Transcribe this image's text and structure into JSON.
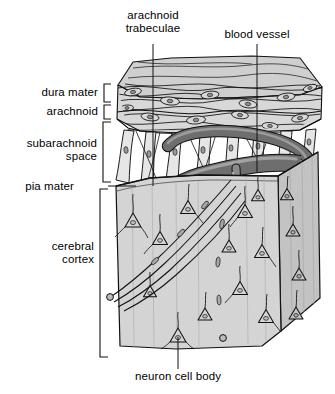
{
  "figure": {
    "type": "anatomical-illustration",
    "style": "grayscale line drawing"
  },
  "labels": {
    "arachnoid_trabeculae": "arachnoid\ntrabeculae",
    "blood_vessel": "blood vessel",
    "dura_mater": "dura mater",
    "arachnoid": "arachnoid",
    "subarachnoid_space": "subarachnoid\nspace",
    "pia_mater": "pia mater",
    "cerebral_cortex": "cerebral\ncortex",
    "neuron_cell_body": "neuron cell body"
  },
  "structures": [
    {
      "name": "dura mater",
      "kind": "membrane-layer",
      "label_side": "left",
      "bracket": true
    },
    {
      "name": "arachnoid",
      "kind": "membrane-layer",
      "label_side": "left",
      "bracket": true
    },
    {
      "name": "subarachnoid space",
      "kind": "space",
      "label_side": "left",
      "bracket": true
    },
    {
      "name": "pia mater",
      "kind": "membrane-layer",
      "label_side": "left",
      "bracket": false
    },
    {
      "name": "cerebral cortex",
      "kind": "tissue-block",
      "label_side": "left",
      "bracket": true
    },
    {
      "name": "arachnoid trabeculae",
      "kind": "strands",
      "label_side": "top",
      "bracket": false
    },
    {
      "name": "blood vessel",
      "kind": "vessel",
      "label_side": "top",
      "bracket": false
    },
    {
      "name": "neuron cell body",
      "kind": "cell",
      "label_side": "bottom",
      "bracket": false
    }
  ],
  "colors": {
    "ink": "#111111",
    "membrane_fill": "#d8d8d8",
    "membrane_top_fill": "#cfcfcf",
    "cortex_fill": "#d2d2d2",
    "cortex_side_fill": "#c0c0c0",
    "vessel_fill": "#6e6e6e",
    "vessel_dark": "#4a4a4a",
    "vessel_lumen": "#3a3a3a",
    "trabecula_fill": "#e2e2e2",
    "background": "#ffffff"
  },
  "counts": {
    "neurons_visible": 16,
    "trabeculae_visible": 14
  }
}
